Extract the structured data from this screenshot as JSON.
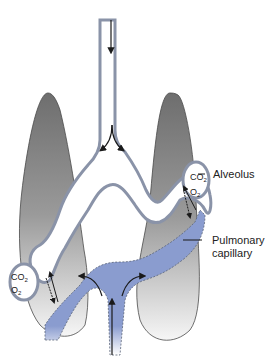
{
  "diagram": {
    "labels": {
      "alveolus": "Alveolus",
      "pulmonary_capillary_line1": "Pulmonary",
      "pulmonary_capillary_line2": "capillary"
    },
    "gases": {
      "co2_base": "CO",
      "o2_base": "O",
      "subscript": "2"
    },
    "colors": {
      "lung_dark": "#6e6e6e",
      "lung_light": "#f4f4f4",
      "airway_wall": "#8a93a8",
      "blood": "#8a9ccf",
      "arrow": "#1a1a1a",
      "outline": "#4a4a4a"
    }
  }
}
